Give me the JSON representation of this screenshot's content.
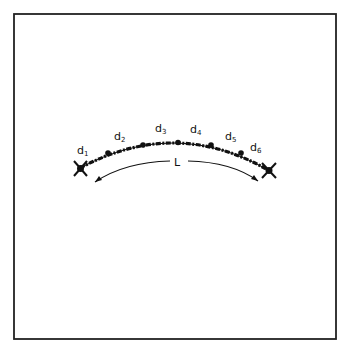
{
  "figure": {
    "segment_labels": [
      {
        "base": "d",
        "sub": "1",
        "x": 77,
        "y": 154
      },
      {
        "base": "d",
        "sub": "2",
        "x": 114,
        "y": 140
      },
      {
        "base": "d",
        "sub": "3",
        "x": 155,
        "y": 132
      },
      {
        "base": "d",
        "sub": "4",
        "x": 190,
        "y": 133
      },
      {
        "base": "d",
        "sub": "5",
        "x": 225,
        "y": 140
      },
      {
        "base": "d",
        "sub": "6",
        "x": 250,
        "y": 151
      }
    ],
    "length_label": "L",
    "colors": {
      "ink": "#111111",
      "background": "#ffffff",
      "frame": "#222222"
    }
  }
}
